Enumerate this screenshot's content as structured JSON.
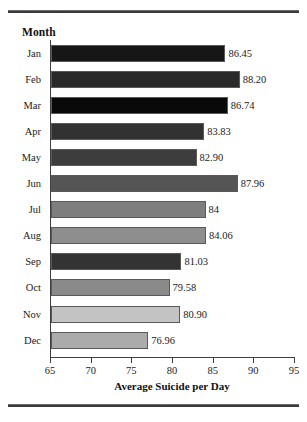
{
  "figure": {
    "axis_title_y": "Month",
    "x_axis_title": "Average Suicide per Day"
  },
  "chart_data": {
    "type": "bar",
    "orientation": "horizontal",
    "title": "",
    "xlabel": "Average Suicide per Day",
    "ylabel": "Month",
    "xlim": [
      65,
      95
    ],
    "xticks": [
      65,
      70,
      75,
      80,
      85,
      90,
      95
    ],
    "xtick_labels": [
      "65",
      "70",
      "75",
      "80",
      "85",
      "90",
      "95"
    ],
    "grid": false,
    "legend": null,
    "categories": [
      "Jan",
      "Feb",
      "Mar",
      "Apr",
      "May",
      "Jun",
      "Jul",
      "Aug",
      "Sep",
      "Oct",
      "Nov",
      "Dec"
    ],
    "values": [
      86.45,
      88.2,
      86.74,
      83.83,
      82.9,
      87.96,
      84,
      84.06,
      81.03,
      79.58,
      80.9,
      76.96
    ],
    "data_labels": [
      "86.45",
      "88.20",
      "86.74",
      "83.83",
      "82.90",
      "87.96",
      "84",
      "84.06",
      "81.03",
      "79.58",
      "80.90",
      "76.96"
    ],
    "bar_colors": [
      "#161616",
      "#2a2a2a",
      "#090909",
      "#323232",
      "#3d3d3d",
      "#555555",
      "#7e7e7e",
      "#8e8e8e",
      "#333333",
      "#8a8a8a",
      "#c3c3c3",
      "#ababab"
    ]
  }
}
